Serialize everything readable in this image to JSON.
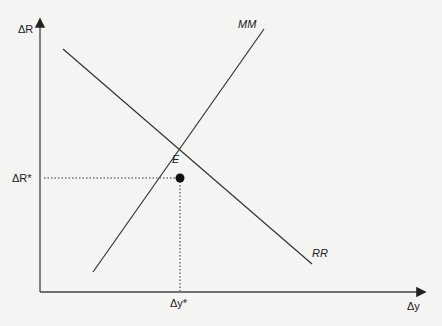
{
  "diagram": {
    "type": "economic-equilibrium",
    "y_axis_label": "ΔR",
    "x_axis_label": "Δy",
    "curves": [
      {
        "name": "MM",
        "label": "MM",
        "slope": "upward"
      },
      {
        "name": "RR",
        "label": "RR",
        "slope": "downward"
      }
    ],
    "equilibrium": {
      "label": "E",
      "x_label": "Δy*",
      "y_label": "ΔR*"
    },
    "colors": {
      "line": "#333333",
      "point": "#111111"
    }
  }
}
